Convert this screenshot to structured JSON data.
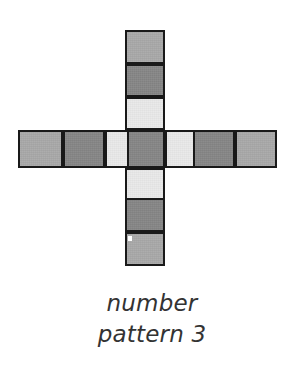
{
  "figure": {
    "title_lines": [
      "number",
      "pattern 3"
    ],
    "caption_line_1": "number",
    "caption_line_2": "pattern 3",
    "background_color": "#ffffff",
    "border_color": "#191919",
    "text_color": "#333333"
  },
  "palette": {
    "medium_gray": "#a8a8a8",
    "dark_gray": "#858585",
    "light_gray": "#e9e9e9"
  },
  "chart_data": {
    "type": "heatmap",
    "title": "number pattern 3",
    "xlabel": "",
    "ylabel": "",
    "shape": "plus-cross",
    "cell_size_px": 38,
    "arm_length": 3,
    "legend": [
      {
        "name": "medium gray",
        "color": "#a8a8a8",
        "code": 1
      },
      {
        "name": "dark gray",
        "color": "#858585",
        "code": 2
      },
      {
        "name": "light gray",
        "color": "#e9e9e9",
        "code": 3
      }
    ],
    "horizontal_arm": {
      "orientation": "horizontal",
      "count": 7,
      "codes": [
        1,
        2,
        3,
        2,
        3,
        2,
        1
      ],
      "colors": [
        "#a8a8a8",
        "#858585",
        "#e9e9e9",
        "#858585",
        "#e9e9e9",
        "#858585",
        "#a8a8a8"
      ]
    },
    "vertical_arm": {
      "orientation": "vertical",
      "count": 7,
      "codes": [
        1,
        2,
        3,
        2,
        3,
        2,
        1
      ],
      "colors": [
        "#a8a8a8",
        "#858585",
        "#e9e9e9",
        "#858585",
        "#e9e9e9",
        "#858585",
        "#a8a8a8"
      ]
    },
    "center_cell": {
      "code": 2,
      "color": "#858585"
    }
  },
  "cells": [
    {
      "id": "v1",
      "name": "cell-up-3",
      "x": 125,
      "y": 30,
      "w": 40,
      "h": 34,
      "color": "#a8a8a8"
    },
    {
      "id": "v2",
      "name": "cell-up-2",
      "x": 125,
      "y": 64,
      "w": 40,
      "h": 33,
      "color": "#858585"
    },
    {
      "id": "v3",
      "name": "cell-up-1",
      "x": 125,
      "y": 97,
      "w": 40,
      "h": 33,
      "color": "#e9e9e9"
    },
    {
      "id": "h1",
      "name": "cell-left-3",
      "x": 18,
      "y": 130,
      "w": 45,
      "h": 38,
      "color": "#a8a8a8"
    },
    {
      "id": "h2",
      "name": "cell-left-2",
      "x": 63,
      "y": 130,
      "w": 42,
      "h": 38,
      "color": "#858585"
    },
    {
      "id": "h3",
      "name": "cell-left-1",
      "x": 105,
      "y": 130,
      "w": 42,
      "h": 38,
      "color": "#e9e9e9"
    },
    {
      "id": "c",
      "name": "cell-center",
      "x": 127,
      "y": 130,
      "w": 38,
      "h": 38,
      "color": "#858585"
    },
    {
      "id": "h5",
      "name": "cell-right-1",
      "x": 165,
      "y": 130,
      "w": 42,
      "h": 38,
      "color": "#e9e9e9"
    },
    {
      "id": "h6",
      "name": "cell-right-2",
      "x": 193,
      "y": 130,
      "w": 42,
      "h": 38,
      "color": "#858585"
    },
    {
      "id": "h7",
      "name": "cell-right-3",
      "x": 235,
      "y": 130,
      "w": 42,
      "h": 38,
      "color": "#a8a8a8"
    },
    {
      "id": "v5",
      "name": "cell-down-1",
      "x": 125,
      "y": 168,
      "w": 40,
      "h": 34,
      "color": "#e9e9e9"
    },
    {
      "id": "v6",
      "name": "cell-down-2",
      "x": 125,
      "y": 198,
      "w": 40,
      "h": 34,
      "color": "#858585"
    },
    {
      "id": "v7",
      "name": "cell-down-3",
      "x": 125,
      "y": 232,
      "w": 40,
      "h": 34,
      "color": "#a8a8a8"
    }
  ],
  "speck": {
    "x": 128,
    "y": 236,
    "color": "#ffffff"
  }
}
